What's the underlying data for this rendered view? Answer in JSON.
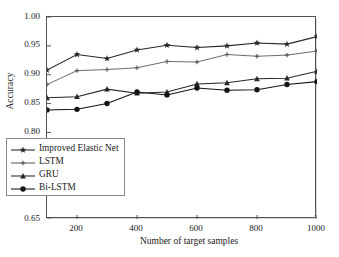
{
  "chart_data": {
    "type": "line",
    "title": "",
    "xlabel": "Number of target samples",
    "ylabel": "Accuracy",
    "x": [
      100,
      200,
      300,
      400,
      500,
      600,
      700,
      800,
      900,
      1000
    ],
    "xlim": [
      100,
      1000
    ],
    "ylim": [
      0.65,
      1.0
    ],
    "xticks": [
      200,
      400,
      600,
      800,
      1000
    ],
    "yticks": [
      "0.65",
      "0.70",
      "0.75",
      "0.80",
      "0.85",
      "0.90",
      "0.95",
      "1.00"
    ],
    "ytick_values": [
      0.65,
      0.7,
      0.75,
      0.8,
      0.85,
      0.9,
      0.95,
      1.0
    ],
    "grid": false,
    "legend_position": "lower-left",
    "series": [
      {
        "name": "Improved Elastic Net",
        "marker": "star",
        "color": "#262626",
        "values": [
          0.908,
          0.935,
          0.928,
          0.943,
          0.951,
          0.947,
          0.95,
          0.955,
          0.953,
          0.966
        ]
      },
      {
        "name": "LSTM",
        "marker": "plus",
        "color": "#5b5b5b",
        "values": [
          0.883,
          0.907,
          0.909,
          0.912,
          0.923,
          0.922,
          0.935,
          0.932,
          0.934,
          0.941
        ]
      },
      {
        "name": "GRU",
        "marker": "triangle",
        "color": "#262626",
        "values": [
          0.86,
          0.862,
          0.875,
          0.868,
          0.87,
          0.884,
          0.886,
          0.893,
          0.894,
          0.906
        ]
      },
      {
        "name": "Bi-LSTM",
        "marker": "circle",
        "color": "#141414",
        "values": [
          0.839,
          0.84,
          0.85,
          0.87,
          0.865,
          0.877,
          0.873,
          0.874,
          0.883,
          0.888
        ]
      }
    ]
  },
  "legend": {
    "items": [
      {
        "label": "Improved Elastic Net",
        "marker": "star"
      },
      {
        "label": "LSTM",
        "marker": "plus"
      },
      {
        "label": "GRU",
        "marker": "triangle"
      },
      {
        "label": "Bi-LSTM",
        "marker": "circle"
      }
    ]
  },
  "axes": {
    "y_title": "Accuracy",
    "x_title": "Number of target samples"
  }
}
